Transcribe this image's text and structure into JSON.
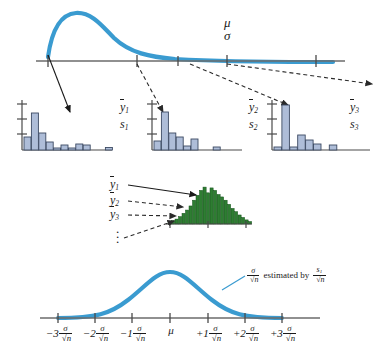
{
  "figure": {
    "colors": {
      "population_curve": "#3a9bd0",
      "normal_curve": "#3a9bd0",
      "sample_bar_fill": "#aebdd8",
      "sample_bar_stroke": "#3c4a63",
      "sampling_bar_fill": "#2e7d32",
      "sampling_bar_stroke": "#14521a",
      "axis": "#6b6b6b",
      "arrow_solid": "#1a1a1a",
      "arrow_dashed": "#4a4a4a",
      "text": "#1a1a1a"
    }
  },
  "population": {
    "parameter_mean_symbol": "μ",
    "parameter_sd_symbol": "σ",
    "axis_tick_count": 5
  },
  "samples": [
    {
      "id": "sample-1",
      "mean_label": "y",
      "mean_subscript": "1",
      "sd_label": "s",
      "sd_subscript": "1",
      "bars": [
        26,
        74,
        34,
        16,
        4,
        10,
        4,
        12,
        10,
        0,
        0,
        5
      ]
    },
    {
      "id": "sample-2",
      "mean_label": "y",
      "mean_subscript": "2",
      "sd_label": "s",
      "sd_subscript": "2",
      "bars": [
        18,
        76,
        34,
        26,
        8,
        22,
        0,
        0,
        6,
        0,
        0,
        0
      ]
    },
    {
      "id": "sample-3",
      "mean_label": "y",
      "mean_subscript": "3",
      "sd_label": "s",
      "sd_subscript": "3",
      "bars": [
        6,
        90,
        6,
        30,
        20,
        12,
        0,
        10,
        0,
        0,
        0,
        0
      ]
    }
  ],
  "sampling_distribution": {
    "arrow_labels": [
      {
        "base": "y",
        "sub": "1",
        "style": "solid"
      },
      {
        "base": "y",
        "sub": "2",
        "style": "dashed"
      },
      {
        "base": "y",
        "sub": "3",
        "style": "dashed"
      }
    ],
    "ellipsis": "⋮",
    "bars": [
      2,
      4,
      6,
      9,
      13,
      17,
      22,
      29,
      35,
      41,
      45,
      38,
      44,
      41,
      36,
      33,
      29,
      24,
      19,
      15,
      11,
      8,
      5,
      3
    ]
  },
  "bottom_curve": {
    "center_label": "μ",
    "tick_labels": [
      {
        "sign": "−3",
        "num": "σ",
        "den_n": "n"
      },
      {
        "sign": "−2",
        "num": "σ",
        "den_n": "n"
      },
      {
        "sign": "−1",
        "num": "σ",
        "den_n": "n"
      },
      {
        "sign": "",
        "num": "",
        "den_n": ""
      },
      {
        "sign": "+1",
        "num": "σ",
        "den_n": "n"
      },
      {
        "sign": "+2",
        "num": "σ",
        "den_n": "n"
      },
      {
        "sign": "+3",
        "num": "σ",
        "den_n": "n"
      }
    ],
    "annotation": {
      "se_numerator": "σ",
      "se_denominator": "n",
      "text": "estimated by",
      "est_numerator": "s",
      "est_numerator_sub": "1",
      "est_denominator": "n"
    }
  }
}
